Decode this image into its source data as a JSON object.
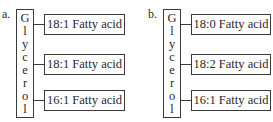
{
  "panels": [
    {
      "label": "a.",
      "backbone": [
        "G",
        "l",
        "y",
        "c",
        "e",
        "r",
        "o",
        "l"
      ],
      "fatty_acids": [
        "18:1 Fatty acid",
        "18:1 Fatty acid",
        "16:1 Fatty acid"
      ]
    },
    {
      "label": "b.",
      "backbone": [
        "G",
        "l",
        "y",
        "c",
        "e",
        "r",
        "o",
        "l"
      ],
      "fatty_acids": [
        "18:0 Fatty acid",
        "18:2 Fatty acid",
        "16:1 Fatty acid"
      ]
    }
  ]
}
